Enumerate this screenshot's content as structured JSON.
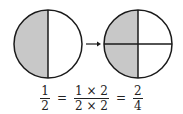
{
  "diagram": {
    "left_circle": {
      "parts": 2,
      "shaded": 1,
      "label": "one half shaded"
    },
    "arrow": {
      "direction": "right"
    },
    "right_circle": {
      "parts": 4,
      "shaded": 2,
      "label": "two quarters shaded"
    },
    "colors": {
      "shade": "#c8c8c8",
      "stroke": "#1a1a1a",
      "background": "#ffffff"
    }
  },
  "equation": {
    "lhs": {
      "num": "1",
      "den": "2"
    },
    "eq1": "=",
    "middle": {
      "num": "1 × 2",
      "den": "2 × 2"
    },
    "eq2": "=",
    "rhs": {
      "num": "2",
      "den": "4"
    }
  }
}
